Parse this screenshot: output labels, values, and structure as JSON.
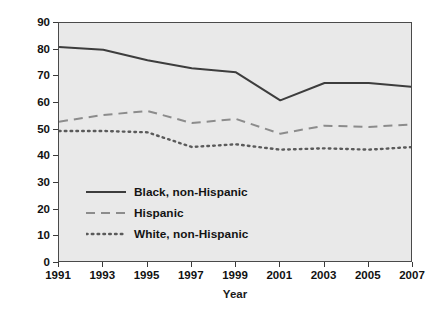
{
  "chart_data": {
    "type": "line",
    "title": "",
    "xlabel": "Year",
    "ylabel": "Percentage",
    "x": [
      1991,
      1993,
      1995,
      1997,
      1999,
      2001,
      2003,
      2005,
      2007
    ],
    "xtick_labels": [
      "1991",
      "1993",
      "1995",
      "1997",
      "1999",
      "2001",
      "2003",
      "2005",
      "2007"
    ],
    "ytick_labels": [
      "0",
      "10",
      "20",
      "30",
      "40",
      "50",
      "60",
      "70",
      "80",
      "90"
    ],
    "ytick_values": [
      0,
      10,
      20,
      30,
      40,
      50,
      60,
      70,
      80,
      90
    ],
    "xlim": [
      1991,
      2007
    ],
    "ylim": [
      0,
      90
    ],
    "grid": false,
    "legend_position": "lower-left-inside",
    "plot_background": "#e9e9e9",
    "series": [
      {
        "name": "Black, non-Hispanic",
        "style": "solid",
        "color": "#3d3d3d",
        "values": [
          81,
          80,
          76,
          73,
          71.5,
          61,
          67.5,
          67.5,
          66
        ]
      },
      {
        "name": "Hispanic",
        "style": "dashed",
        "color": "#8c8c8c",
        "values": [
          53,
          55.5,
          57,
          52.5,
          54,
          48.5,
          51.5,
          51,
          52
        ]
      },
      {
        "name": "White, non-Hispanic",
        "style": "dotted",
        "color": "#5a5a5a",
        "values": [
          49.5,
          49.5,
          49,
          43.5,
          44.5,
          42.5,
          43,
          42.5,
          43.5
        ]
      }
    ]
  }
}
